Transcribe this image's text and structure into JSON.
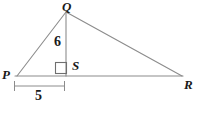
{
  "figure": {
    "type": "geometry-diagram",
    "background_color": "#ffffff",
    "stroke_color": "#8c8c8c",
    "text_color": "#1a1a1a",
    "vertices": [
      {
        "name": "Q",
        "label": "Q",
        "x": 66,
        "y": 12
      },
      {
        "name": "P",
        "label": "P",
        "x": 17,
        "y": 76
      },
      {
        "name": "S",
        "label": "S",
        "x": 66,
        "y": 76
      },
      {
        "name": "R",
        "label": "R",
        "x": 182,
        "y": 76
      }
    ],
    "segments": [
      {
        "name": "PQ",
        "from": "P",
        "to": "Q"
      },
      {
        "name": "QR",
        "from": "Q",
        "to": "R"
      },
      {
        "name": "PR",
        "from": "P",
        "to": "R"
      },
      {
        "name": "QS",
        "from": "Q",
        "to": "S"
      }
    ],
    "right_angle": {
      "at": "S",
      "between": [
        "QS",
        "SP"
      ],
      "marker": "square"
    },
    "measurements": [
      {
        "name": "altitude-QS",
        "value": "6",
        "segment": "QS",
        "label_x": 54,
        "label_y": 35
      },
      {
        "name": "base-PS",
        "value": "5",
        "segment": "PS",
        "label_x": 35,
        "label_y": 89,
        "dimension_line": {
          "x1": 14,
          "x2": 65,
          "y": 86,
          "tick_half_height": 5
        }
      }
    ]
  }
}
